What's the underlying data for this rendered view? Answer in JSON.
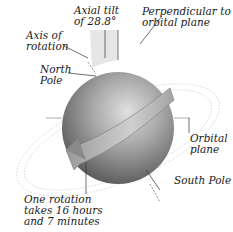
{
  "diagram": {
    "labels": {
      "axial_tilt": [
        "Axial tilt",
        "of 28.8°"
      ],
      "perpendicular": [
        "Perpendicular to",
        "orbital plane"
      ],
      "axis_of_rotation": [
        "Axis of",
        "rotation"
      ],
      "north_pole": [
        "North",
        "Pole"
      ],
      "orbital_plane": [
        "Orbital",
        "plane"
      ],
      "south_pole": [
        "South Pole"
      ],
      "rotation_period": [
        "One rotation",
        "takes 16 hours",
        "and 7 minutes"
      ]
    },
    "values": {
      "axial_tilt_degrees": "28.8°",
      "rotation_hours": "16",
      "rotation_minutes": "7"
    },
    "colors": {
      "planet_light": "#d6d6d6",
      "planet_dark": "#5e5e5e",
      "tilt_wedge": "#e4e4e4",
      "ring": "#b9b9b9",
      "line": "#333333",
      "text": "#1a1a1a"
    }
  }
}
